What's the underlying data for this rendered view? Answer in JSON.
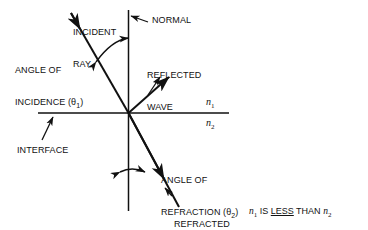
{
  "diagram": {
    "stroke_color": "#111111",
    "background_color": "#ffffff",
    "labels": {
      "incident_ray_line1": "INCIDENT",
      "incident_ray_line2": "RAY",
      "normal": "NORMAL",
      "angle_of_incidence_line1": "ANGLE OF",
      "angle_of_incidence_line2_prefix": "INCIDENCE (θ",
      "angle_of_incidence_sub": "1",
      "angle_of_incidence_line2_suffix": ")",
      "reflected_wave_line1": "REFLECTED",
      "reflected_wave_line2": "WAVE",
      "interface": "INTERFACE",
      "angle_of_refraction_line1": "ANGLE OF",
      "angle_of_refraction_line2_prefix": "REFRACTION (θ",
      "angle_of_refraction_sub": "2",
      "angle_of_refraction_line2_suffix": ")",
      "refracted_ray_line1": "REFRACTED",
      "refracted_ray_line2": "RAY"
    },
    "indices": {
      "upper_medium_symbol": "n",
      "upper_medium_sub": "1",
      "lower_medium_symbol": "n",
      "lower_medium_sub": "2"
    },
    "note": {
      "first_symbol": "n",
      "first_sub": "1",
      "text_before": " IS ",
      "emphasis": "LESS",
      "text_after": " THAN ",
      "second_symbol": "n",
      "second_sub": "2"
    }
  }
}
